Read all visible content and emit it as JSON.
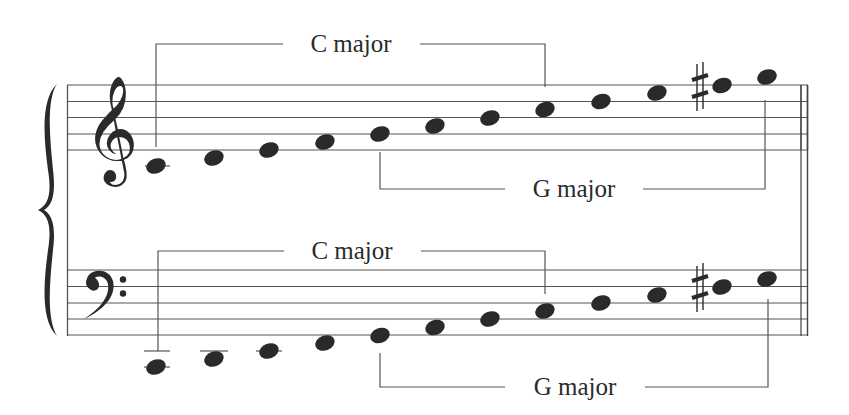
{
  "diagram": {
    "type": "grand-staff-scale-comparison",
    "colors": {
      "ink": "#2a2a2a",
      "line": "#555555",
      "background": "#ffffff"
    },
    "treble_staff": {
      "clef": "treble",
      "brackets": {
        "top": {
          "label": "C major",
          "from_note": 1,
          "to_note": 8
        },
        "bottom": {
          "label": "G major",
          "from_note": 5,
          "to_note": 12
        }
      },
      "notes": [
        "C4",
        "D4",
        "E4",
        "F4",
        "G4",
        "A4",
        "B4",
        "C5",
        "D5",
        "E5",
        "F#5",
        "G5"
      ]
    },
    "bass_staff": {
      "clef": "bass",
      "brackets": {
        "top": {
          "label": "C major",
          "from_note": 1,
          "to_note": 8
        },
        "bottom": {
          "label": "G major",
          "from_note": 5,
          "to_note": 12
        }
      },
      "notes": [
        "C2",
        "D2",
        "E2",
        "F2",
        "G2",
        "A2",
        "B2",
        "C3",
        "D3",
        "E3",
        "F#3",
        "G3"
      ]
    },
    "labels": {
      "treble_c_major": "C major",
      "treble_g_major": "G major",
      "bass_c_major": "C major",
      "bass_g_major": "G major"
    },
    "accidental_symbol": "♯"
  }
}
